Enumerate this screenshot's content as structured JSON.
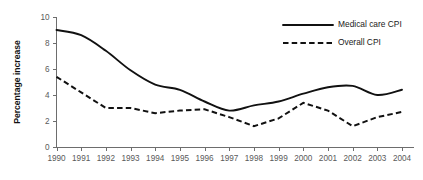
{
  "chart_data": {
    "type": "line",
    "title": "",
    "xlabel": "",
    "ylabel": "Percentage increase",
    "x": [
      1990,
      1991,
      1992,
      1993,
      1994,
      1995,
      1996,
      1997,
      1998,
      1999,
      2000,
      2001,
      2002,
      2003,
      2004
    ],
    "categories": [
      "1990",
      "1991",
      "1992",
      "1993",
      "1994",
      "1995",
      "1996",
      "1997",
      "1998",
      "1999",
      "2000",
      "2001",
      "2002",
      "2003",
      "2004"
    ],
    "series": [
      {
        "name": "Medical care CPI",
        "style": "solid",
        "color": "#111111",
        "values": [
          9.0,
          8.6,
          7.4,
          5.9,
          4.8,
          4.4,
          3.5,
          2.8,
          3.2,
          3.5,
          4.1,
          4.6,
          4.7,
          4.0,
          4.4
        ]
      },
      {
        "name": "Overall CPI",
        "style": "dashed",
        "color": "#111111",
        "values": [
          5.4,
          4.2,
          3.0,
          3.0,
          2.6,
          2.8,
          2.9,
          2.3,
          1.6,
          2.2,
          3.4,
          2.8,
          1.6,
          2.3,
          2.7
        ]
      }
    ],
    "ylim": [
      0,
      10
    ],
    "yticks": [
      0,
      2,
      4,
      6,
      8,
      10
    ],
    "ytick_labels": [
      "0",
      "2",
      "4",
      "6",
      "8",
      "10"
    ],
    "grid": false,
    "legend_position": "top-right",
    "legend_entries": [
      "Medical care CPI",
      "Overall CPI"
    ]
  },
  "colors": {
    "axis": "#6d6d6d",
    "tick_text": "#5a5a5a",
    "series_line": "#111111",
    "background": "#ffffff"
  }
}
